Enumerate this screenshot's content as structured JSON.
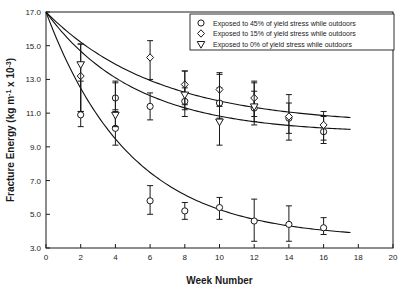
{
  "chart_data": {
    "type": "scatter",
    "title": "",
    "xlabel": "Week Number",
    "ylabel": "Fracture Energy (kg m-1 x 10-3)",
    "ylabel_parts": {
      "main": "Fracture Energy (kg m",
      "sup1": "-1",
      "mid": " x 10",
      "sup2": "-3",
      "tail": ")"
    },
    "xlim": [
      0,
      20
    ],
    "ylim": [
      3.0,
      17.0
    ],
    "xticks": [
      0,
      2,
      4,
      6,
      8,
      10,
      12,
      14,
      16,
      18,
      20
    ],
    "xtick_labels": [
      "0",
      "2",
      "4",
      "6",
      "8",
      "10",
      "12",
      "14",
      "16",
      "18",
      "20"
    ],
    "yticks": [
      3.0,
      5.0,
      7.0,
      9.0,
      11.0,
      13.0,
      15.0,
      17.0
    ],
    "ytick_labels": [
      "3.0",
      "5.0",
      "7.0",
      "9.0",
      "11.0",
      "13.0",
      "15.0",
      "17.0"
    ],
    "grid": false,
    "legend_position": "top-right",
    "series": [
      {
        "name": "Exposed to 45% of yield stress while outdoors",
        "marker": "circle",
        "points": [
          {
            "x": 2,
            "y": 10.9,
            "err_low": 10.2,
            "err_high": 12.9
          },
          {
            "x": 4,
            "y": 10.1,
            "err_low": 9.1,
            "err_high": 11.1
          },
          {
            "x": 4,
            "y": 11.9,
            "err_low": 11.2,
            "err_high": 12.8
          },
          {
            "x": 6,
            "y": 11.4,
            "err_low": 10.6,
            "err_high": 12.2
          },
          {
            "x": 8,
            "y": 11.7,
            "err_low": 10.8,
            "err_high": 12.5
          },
          {
            "x": 10,
            "y": 11.6,
            "err_low": 10.7,
            "err_high": 12.5
          },
          {
            "x": 12,
            "y": 11.3,
            "err_low": 10.5,
            "err_high": 12.3
          },
          {
            "x": 14,
            "y": 10.7,
            "err_low": 9.8,
            "err_high": 11.6
          },
          {
            "x": 16,
            "y": 9.9,
            "err_low": 9.2,
            "err_high": 10.8
          },
          {
            "x": 6,
            "y": 5.8,
            "err_low": 5.0,
            "err_high": 6.7
          },
          {
            "x": 8,
            "y": 5.2,
            "err_low": 4.7,
            "err_high": 5.7
          },
          {
            "x": 10,
            "y": 5.4,
            "err_low": 4.7,
            "err_high": 6.0
          },
          {
            "x": 12,
            "y": 4.6,
            "err_low": 3.4,
            "err_high": 5.9
          },
          {
            "x": 14,
            "y": 4.4,
            "err_low": 3.4,
            "err_high": 5.5
          },
          {
            "x": 16,
            "y": 4.2,
            "err_low": 3.8,
            "err_high": 4.8
          }
        ]
      },
      {
        "name": "Exposed to 15% of yield stress while outdoors",
        "marker": "diamond",
        "points": [
          {
            "x": 2,
            "y": 13.2,
            "err_low": 11.1,
            "err_high": 15.1
          },
          {
            "x": 6,
            "y": 14.3,
            "err_low": 13.0,
            "err_high": 15.3
          },
          {
            "x": 8,
            "y": 12.7,
            "err_low": 11.5,
            "err_high": 13.5
          },
          {
            "x": 10,
            "y": 12.4,
            "err_low": 11.4,
            "err_high": 13.4
          },
          {
            "x": 12,
            "y": 11.9,
            "err_low": 10.8,
            "err_high": 12.9
          },
          {
            "x": 14,
            "y": 10.8,
            "err_low": 9.4,
            "err_high": 12.1
          },
          {
            "x": 16,
            "y": 10.3,
            "err_low": 9.4,
            "err_high": 11.1
          }
        ]
      },
      {
        "name": "Exposed to 0% of yield stress while outdoors",
        "marker": "triangle-down",
        "points": [
          {
            "x": 2,
            "y": 13.9,
            "err_low": 11.1,
            "err_high": 15.1
          },
          {
            "x": 4,
            "y": 10.9,
            "err_low": 10.2,
            "err_high": 12.9
          },
          {
            "x": 8,
            "y": 12.1,
            "err_low": 11.2,
            "err_high": 13.5
          },
          {
            "x": 10,
            "y": 10.5,
            "err_low": 9.1,
            "err_high": 13.3
          },
          {
            "x": 12,
            "y": 11.4,
            "err_low": 10.3,
            "err_high": 12.8
          }
        ]
      }
    ],
    "fit_curves": [
      {
        "name": "fit-0pct",
        "y0": 17.0,
        "asymptote": 10.3,
        "rate": 0.155
      },
      {
        "name": "fit-15pct",
        "y0": 17.0,
        "asymptote": 9.8,
        "rate": 0.195
      },
      {
        "name": "fit-45pct",
        "y0": 17.0,
        "asymptote": 3.55,
        "rate": 0.205
      }
    ],
    "colors": {
      "axis": "#1a1a1a",
      "marker": "#1a1a1a",
      "curve": "#111111",
      "background": "#ffffff"
    }
  }
}
